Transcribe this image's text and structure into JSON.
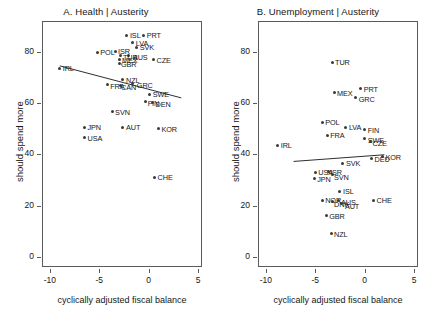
{
  "figure": {
    "width": 425,
    "height": 318,
    "background": "#ffffff",
    "point_color": "#3a3a3a",
    "line_color": "#2e2e2e",
    "axis_color": "#5a5a5a"
  },
  "chart_data": [
    {
      "id": "panel-a",
      "type": "scatter",
      "title": "A. Health | Austerity",
      "xlabel": "cyclically adjusted fiscal balance",
      "ylabel": "should spend more",
      "xlim": [
        -10.8,
        5.4
      ],
      "ylim": [
        -4,
        92
      ],
      "xticks": [
        -10,
        -5,
        0,
        5
      ],
      "xticklabels": [
        "-10",
        "-5",
        "0",
        "5"
      ],
      "yticks": [
        0,
        20,
        40,
        60,
        80
      ],
      "yticklabels": [
        "0",
        "20",
        "40",
        "60",
        "80"
      ],
      "grid": false,
      "legend": "none",
      "fit_line": {
        "x0": -9.0,
        "y0": 74.5,
        "x1": 3.3,
        "y1": 62.0
      },
      "points": [
        {
          "label": "ISL",
          "x": -2.2,
          "y": 86.5,
          "lx": 3,
          "ly": -4
        },
        {
          "label": "PRT",
          "x": -0.5,
          "y": 86.5,
          "lx": 3,
          "ly": -4
        },
        {
          "label": "LVA",
          "x": -1.6,
          "y": 83.5,
          "lx": 3,
          "ly": -4
        },
        {
          "label": "SVK",
          "x": -1.2,
          "y": 81.8,
          "lx": 3,
          "ly": -4
        },
        {
          "label": "POL",
          "x": -5.2,
          "y": 79.8,
          "lx": 3,
          "ly": -4
        },
        {
          "label": "ISR",
          "x": -3.4,
          "y": 80.2,
          "lx": 3,
          "ly": -4
        },
        {
          "label": "AUS",
          "x": -2.0,
          "y": 78.5,
          "lx": 4,
          "ly": -3
        },
        {
          "label": "TUR",
          "x": -2.9,
          "y": 78.4,
          "lx": 0,
          "ly": -3
        },
        {
          "label": "MEX",
          "x": -3.0,
          "y": 77.0,
          "lx": 0,
          "ly": -3
        },
        {
          "label": "GBR",
          "x": -3.0,
          "y": 75.6,
          "lx": 2,
          "ly": -3
        },
        {
          "label": "CZE",
          "x": 0.5,
          "y": 76.8,
          "lx": 3,
          "ly": -4
        },
        {
          "label": "IRL",
          "x": -9.0,
          "y": 73.5,
          "lx": 3,
          "ly": -4
        },
        {
          "label": "NZL",
          "x": -2.6,
          "y": 69.2,
          "lx": 0,
          "ly": -3
        },
        {
          "label": "GRC",
          "x": -1.6,
          "y": 67.5,
          "lx": 4,
          "ly": -3
        },
        {
          "label": "FRA",
          "x": -4.2,
          "y": 67.2,
          "lx": 3,
          "ly": -3
        },
        {
          "label": "CAN",
          "x": -2.9,
          "y": 67.0,
          "lx": 1,
          "ly": -2
        },
        {
          "label": "SWE",
          "x": 0.1,
          "y": 63.5,
          "lx": 3,
          "ly": -4
        },
        {
          "label": "FIN",
          "x": -0.3,
          "y": 60.5,
          "lx": 2,
          "ly": -3
        },
        {
          "label": "DEN",
          "x": 0.4,
          "y": 60.2,
          "lx": 3,
          "ly": -2
        },
        {
          "label": "SVN",
          "x": -3.7,
          "y": 56.5,
          "lx": 3,
          "ly": -4
        },
        {
          "label": "JPN",
          "x": -6.5,
          "y": 50.5,
          "lx": 3,
          "ly": -4
        },
        {
          "label": "AUT",
          "x": -2.6,
          "y": 50.5,
          "lx": 3,
          "ly": -4
        },
        {
          "label": "KOR",
          "x": 1.0,
          "y": 50.0,
          "lx": 3,
          "ly": -4
        },
        {
          "label": "USA",
          "x": -6.5,
          "y": 46.5,
          "lx": 3,
          "ly": -4
        },
        {
          "label": "CHE",
          "x": 0.6,
          "y": 31.0,
          "lx": 3,
          "ly": -4
        }
      ]
    },
    {
      "id": "panel-b",
      "type": "scatter",
      "title": "B. Unemployment | Austerity",
      "xlabel": "cyclically adjusted fiscal balance",
      "ylabel": "should spend more",
      "xlim": [
        -10.8,
        5.4
      ],
      "ylim": [
        -4,
        92
      ],
      "xticks": [
        -10,
        -5,
        0,
        5
      ],
      "xticklabels": [
        "-10",
        "-5",
        "0",
        "5"
      ],
      "yticks": [
        0,
        20,
        40,
        60,
        80
      ],
      "yticklabels": [
        "0",
        "20",
        "40",
        "60",
        "80"
      ],
      "grid": false,
      "legend": "none",
      "fit_line": {
        "x0": -7.2,
        "y0": 37.2,
        "x1": 2.0,
        "y1": 39.8
      },
      "points": [
        {
          "label": "TUR",
          "x": -3.3,
          "y": 76.0,
          "lx": 3,
          "ly": -4
        },
        {
          "label": "PRT",
          "x": -0.4,
          "y": 65.5,
          "lx": 3,
          "ly": -4
        },
        {
          "label": "MEX",
          "x": -3.1,
          "y": 64.0,
          "lx": 3,
          "ly": -4
        },
        {
          "label": "GRC",
          "x": -0.9,
          "y": 62.0,
          "lx": 3,
          "ly": -3
        },
        {
          "label": "POL",
          "x": -4.3,
          "y": 52.5,
          "lx": 3,
          "ly": -4
        },
        {
          "label": "LVA",
          "x": -1.9,
          "y": 50.5,
          "lx": 3,
          "ly": -4
        },
        {
          "label": "FIN",
          "x": 0.0,
          "y": 49.5,
          "lx": 3,
          "ly": -4
        },
        {
          "label": "FRA",
          "x": -3.8,
          "y": 47.5,
          "lx": 3,
          "ly": -4
        },
        {
          "label": "SWE",
          "x": 0.0,
          "y": 46.0,
          "lx": 3,
          "ly": -3
        },
        {
          "label": "CZE",
          "x": 0.6,
          "y": 45.0,
          "lx": 2,
          "ly": -2
        },
        {
          "label": "IRL",
          "x": -8.8,
          "y": 43.5,
          "lx": 3,
          "ly": -4
        },
        {
          "label": "DEU",
          "x": 0.7,
          "y": 38.5,
          "lx": 3,
          "ly": -3
        },
        {
          "label": "KOR",
          "x": 1.8,
          "y": 39.0,
          "lx": 3,
          "ly": -4
        },
        {
          "label": "SVK",
          "x": -2.2,
          "y": 36.5,
          "lx": 3,
          "ly": -4
        },
        {
          "label": "USA",
          "x": -5.0,
          "y": 33.0,
          "lx": 3,
          "ly": -4
        },
        {
          "label": "ISR",
          "x": -3.7,
          "y": 33.2,
          "lx": 2,
          "ly": -4
        },
        {
          "label": "SVN",
          "x": -3.3,
          "y": 32.0,
          "lx": 2,
          "ly": -2
        },
        {
          "label": "JPN",
          "x": -5.1,
          "y": 30.5,
          "lx": 3,
          "ly": -4
        },
        {
          "label": "ISL",
          "x": -2.5,
          "y": 25.5,
          "lx": 3,
          "ly": -4
        },
        {
          "label": "NOR",
          "x": -4.3,
          "y": 22.0,
          "lx": 3,
          "ly": -4
        },
        {
          "label": "DNK",
          "x": -3.3,
          "y": 21.5,
          "lx": 2,
          "ly": -2
        },
        {
          "label": "AUS",
          "x": -2.6,
          "y": 21.8,
          "lx": 2,
          "ly": -3
        },
        {
          "label": "AUT",
          "x": -2.3,
          "y": 20.8,
          "lx": 3,
          "ly": -1
        },
        {
          "label": "CHE",
          "x": 0.9,
          "y": 22.0,
          "lx": 3,
          "ly": -4
        },
        {
          "label": "GBR",
          "x": -3.9,
          "y": 16.0,
          "lx": 3,
          "ly": -4
        },
        {
          "label": "NZL",
          "x": -3.4,
          "y": 9.0,
          "lx": 3,
          "ly": -4
        }
      ]
    }
  ]
}
